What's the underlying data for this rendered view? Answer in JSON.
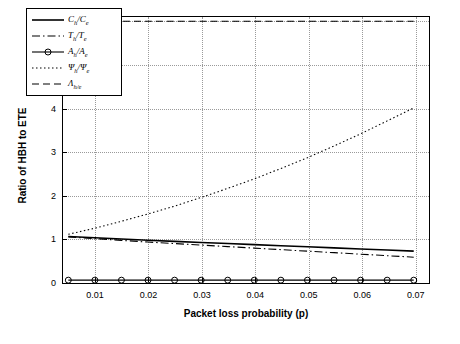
{
  "chart_data": {
    "type": "line",
    "title": "",
    "xlabel": "Packet loss probability (p)",
    "ylabel": "Ratio of HBH to ETE",
    "xlim": [
      0.004,
      0.0725
    ],
    "ylim": [
      0,
      6.1
    ],
    "grid": true,
    "legend_position": "upper-left",
    "xticks": [
      0.01,
      0.02,
      0.03,
      0.04,
      0.05,
      0.06,
      0.07
    ],
    "xtick_labels": [
      "0.01",
      "0.02",
      "0.03",
      "0.04",
      "0.05",
      "0.06",
      "0.07"
    ],
    "yticks": [
      0,
      1,
      2,
      3,
      4,
      5,
      6
    ],
    "ytick_labels": [
      "0",
      "1",
      "2",
      "3",
      "4",
      "5",
      "6"
    ],
    "x": [
      0.005,
      0.01,
      0.015,
      0.02,
      0.025,
      0.03,
      0.035,
      0.04,
      0.045,
      0.05,
      0.055,
      0.06,
      0.065,
      0.07
    ],
    "series": [
      {
        "name": "C_h/C_e",
        "label_main": "C",
        "label_sub1": "h",
        "label_main2": "C",
        "label_sub2": "e",
        "style": "solid",
        "marker": "none",
        "values": [
          1.03,
          1.0,
          0.97,
          0.94,
          0.915,
          0.89,
          0.865,
          0.84,
          0.815,
          0.79,
          0.765,
          0.74,
          0.715,
          0.69
        ]
      },
      {
        "name": "T_h/T_e",
        "label_main": "T",
        "label_sub1": "h",
        "label_main2": "T",
        "label_sub2": "e",
        "style": "dash-dot",
        "marker": "none",
        "values": [
          1.02,
          0.98,
          0.94,
          0.9,
          0.865,
          0.83,
          0.795,
          0.76,
          0.725,
          0.69,
          0.655,
          0.62,
          0.585,
          0.55
        ]
      },
      {
        "name": "A_h/A_e",
        "label_main": "A",
        "label_sub1": "h",
        "label_main2": "A",
        "label_sub2": "e",
        "style": "solid",
        "marker": "circle",
        "values": [
          0.02,
          0.02,
          0.02,
          0.02,
          0.02,
          0.02,
          0.02,
          0.02,
          0.02,
          0.02,
          0.02,
          0.02,
          0.02,
          0.02
        ]
      },
      {
        "name": "Psi_h/Psi_e",
        "label_main": "Ψ",
        "label_sub1": "h",
        "label_main2": "Ψ",
        "label_sub2": "e",
        "style": "dotted",
        "marker": "none",
        "values": [
          1.08,
          1.22,
          1.38,
          1.55,
          1.73,
          1.93,
          2.14,
          2.36,
          2.6,
          2.85,
          3.12,
          3.4,
          3.7,
          4.0
        ]
      },
      {
        "name": "Lambda_h/e",
        "label_main": "Λ",
        "label_sub1": "h/e",
        "label_main2": "",
        "label_sub2": "",
        "style": "dashed",
        "marker": "none",
        "values": [
          6.0,
          6.0,
          6.0,
          6.0,
          6.0,
          6.0,
          6.0,
          6.0,
          6.0,
          6.0,
          6.0,
          6.0,
          6.0,
          6.0
        ]
      }
    ]
  },
  "colors": {
    "axis": "#000000",
    "grid": "#9a9a9a",
    "background": "#ffffff"
  }
}
